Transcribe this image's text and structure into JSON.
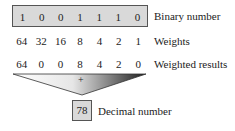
{
  "binary": {
    "label": "Binary number",
    "digits": [
      "1",
      "0",
      "0",
      "1",
      "1",
      "1",
      "0"
    ]
  },
  "weights": {
    "label": "Weights",
    "values": [
      "64",
      "32",
      "16",
      "8",
      "4",
      "2",
      "1"
    ]
  },
  "results": {
    "label": "Weighted results",
    "values": [
      "64",
      "0",
      "0",
      "8",
      "4",
      "2",
      "0"
    ]
  },
  "sum": {
    "symbol": "+"
  },
  "decimal": {
    "label": "Decimal number",
    "value": "78"
  },
  "colors": {
    "box_fill": "#d9d9d9",
    "box_border": "#555555",
    "triangle_dark": "#222222"
  }
}
